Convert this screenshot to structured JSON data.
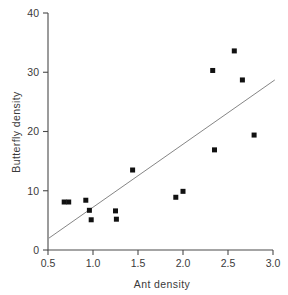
{
  "chart_data": {
    "type": "scatter",
    "title": "",
    "xlabel": "Ant density",
    "ylabel": "Butterfly density",
    "xlim": [
      0.5,
      3.0
    ],
    "ylim": [
      0,
      40
    ],
    "grid": false,
    "legend": null,
    "xticks": [
      "0.5",
      "1.0",
      "1.5",
      "2.0",
      "2.5",
      "3.0"
    ],
    "xtick_values": [
      0.5,
      1.0,
      1.5,
      2.0,
      2.5,
      3.0
    ],
    "yticks": [
      "0",
      "10",
      "20",
      "30",
      "40"
    ],
    "ytick_values": [
      0,
      10,
      20,
      30,
      40
    ],
    "points": [
      {
        "x": 0.68,
        "y": 8.1
      },
      {
        "x": 0.73,
        "y": 8.1
      },
      {
        "x": 0.92,
        "y": 8.4
      },
      {
        "x": 0.96,
        "y": 6.7
      },
      {
        "x": 0.98,
        "y": 5.1
      },
      {
        "x": 1.25,
        "y": 6.6
      },
      {
        "x": 1.26,
        "y": 5.2
      },
      {
        "x": 1.44,
        "y": 13.5
      },
      {
        "x": 1.92,
        "y": 8.9
      },
      {
        "x": 2.0,
        "y": 9.9
      },
      {
        "x": 2.33,
        "y": 30.3
      },
      {
        "x": 2.35,
        "y": 16.9
      },
      {
        "x": 2.57,
        "y": 33.6
      },
      {
        "x": 2.66,
        "y": 28.7
      },
      {
        "x": 2.79,
        "y": 19.4
      }
    ],
    "trend_line": {
      "x_start": 0.51,
      "y_start": 2.0,
      "x_end": 3.02,
      "y_end": 28.7
    },
    "marker": {
      "shape": "square",
      "size_px": 5,
      "color": "#111111"
    },
    "line_color": "#777777"
  }
}
